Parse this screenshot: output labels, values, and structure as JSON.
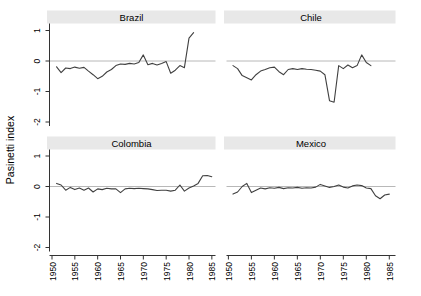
{
  "chart_data": {
    "type": "line",
    "title": "",
    "ylabel": "Pasinetti index",
    "xlabel": "",
    "ylim": [
      -2,
      1
    ],
    "xlim": [
      1950,
      1986
    ],
    "grid": false,
    "legend": "none",
    "zero_reference_line": true,
    "y_tick_values": [
      1,
      0,
      -1,
      -2
    ],
    "y_tick_labels": [
      "1",
      "0",
      "-1",
      "-2"
    ],
    "x_tick_values": [
      1950,
      1955,
      1960,
      1965,
      1970,
      1975,
      1980,
      1985
    ],
    "x_tick_labels": [
      "1950",
      "1955",
      "1960",
      "1965",
      "1970",
      "1975",
      "1980",
      "1985"
    ],
    "tick_label_rotation_deg": 90,
    "colors": {
      "title_band": "#e8e8e8",
      "zero_line": "#b8b8b8",
      "series_line": "#404040",
      "axis": "#333333",
      "text": "#000000",
      "background": "#ffffff"
    },
    "panels": [
      {
        "title": "Brazil",
        "x_start": 1951,
        "x_step": 1,
        "values": [
          -0.19,
          -0.38,
          -0.23,
          -0.25,
          -0.2,
          -0.24,
          -0.21,
          -0.33,
          -0.45,
          -0.58,
          -0.5,
          -0.36,
          -0.28,
          -0.15,
          -0.1,
          -0.11,
          -0.08,
          -0.1,
          -0.05,
          0.2,
          -0.12,
          -0.08,
          -0.13,
          -0.08,
          -0.02,
          -0.4,
          -0.3,
          -0.15,
          -0.22,
          0.75,
          0.93
        ]
      },
      {
        "title": "Chile",
        "x_start": 1951,
        "x_step": 1,
        "values": [
          -0.15,
          -0.25,
          -0.48,
          -0.55,
          -0.62,
          -0.45,
          -0.33,
          -0.28,
          -0.22,
          -0.2,
          -0.35,
          -0.45,
          -0.28,
          -0.25,
          -0.28,
          -0.25,
          -0.27,
          -0.28,
          -0.3,
          -0.33,
          -0.45,
          -1.3,
          -1.35,
          -0.15,
          -0.25,
          -0.13,
          -0.22,
          -0.15,
          0.2,
          -0.05,
          -0.15
        ]
      },
      {
        "title": "Colombia",
        "x_start": 1951,
        "x_step": 1,
        "values": [
          0.1,
          0.05,
          -0.12,
          -0.03,
          -0.1,
          -0.05,
          -0.12,
          -0.05,
          -0.18,
          -0.08,
          -0.1,
          -0.06,
          -0.08,
          -0.08,
          -0.2,
          -0.08,
          -0.06,
          -0.07,
          -0.06,
          -0.07,
          -0.08,
          -0.1,
          -0.13,
          -0.12,
          -0.12,
          -0.15,
          -0.12,
          0.05,
          -0.15,
          -0.05,
          0.02,
          0.1,
          0.35,
          0.36,
          0.32
        ]
      },
      {
        "title": "Mexico",
        "x_start": 1951,
        "x_step": 1,
        "values": [
          -0.25,
          -0.18,
          0.0,
          0.1,
          -0.2,
          -0.12,
          -0.05,
          -0.08,
          -0.04,
          -0.06,
          -0.03,
          -0.07,
          -0.04,
          -0.05,
          -0.03,
          -0.06,
          -0.04,
          -0.05,
          -0.02,
          0.07,
          0.02,
          -0.03,
          0.0,
          0.05,
          -0.02,
          -0.05,
          0.02,
          0.05,
          0.03,
          -0.05,
          -0.07,
          -0.3,
          -0.4,
          -0.28,
          -0.25
        ]
      }
    ]
  }
}
